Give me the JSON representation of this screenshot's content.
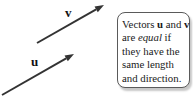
{
  "figure": {
    "arrow_color": "#333333",
    "label_color": "#111111",
    "vectors": [
      {
        "id": "v",
        "label": "v",
        "x1": 37,
        "y1": 43,
        "x2": 104,
        "y2": 5,
        "label_x": 65,
        "label_y": 17
      },
      {
        "id": "u",
        "label": "u",
        "x1": 2,
        "y1": 95,
        "x2": 74,
        "y2": 54,
        "label_x": 31,
        "label_y": 66
      }
    ]
  },
  "callout": {
    "background": "#ffffff",
    "border_color": "#5a5a5a",
    "text_plain": "Vectors u and v are equal if they have the same length and direction.",
    "lines": [
      [
        {
          "text": "Vectors "
        },
        {
          "text": "u",
          "bold": true
        },
        {
          "text": " and "
        },
        {
          "text": "v",
          "bold": true
        }
      ],
      [
        {
          "text": "are "
        },
        {
          "text": "equal",
          "italic": true
        },
        {
          "text": " if"
        }
      ],
      [
        {
          "text": "they have the"
        }
      ],
      [
        {
          "text": "same length"
        }
      ],
      [
        {
          "text": "and direction."
        }
      ]
    ]
  }
}
